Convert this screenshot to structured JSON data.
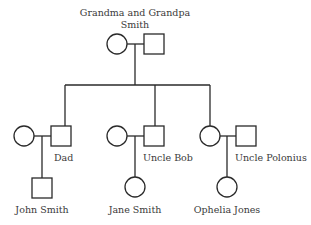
{
  "diagram": {
    "type": "pedigree",
    "generations": [
      {
        "label_line1": "Grandma and Grandpa",
        "label_line2": "Smith",
        "members": [
          {
            "sex": "female"
          },
          {
            "sex": "male"
          }
        ]
      }
    ],
    "couples": [
      {
        "female": "",
        "male": "Dad",
        "child": {
          "name": "John Smith",
          "sex": "male"
        }
      },
      {
        "female": "",
        "male": "Uncle Bob",
        "child": {
          "name": "Jane Smith",
          "sex": "female"
        }
      },
      {
        "female": "",
        "male": "Uncle Polonius",
        "child": {
          "name": "Ophelia Jones",
          "sex": "female"
        }
      }
    ]
  },
  "labels": {
    "grandparents_1": "Grandma and Grandpa",
    "grandparents_2": "Smith",
    "dad": "Dad",
    "uncle_bob": "Uncle Bob",
    "uncle_polonius": "Uncle Polonius",
    "john": "John Smith",
    "jane": "Jane Smith",
    "ophelia": "Ophelia Jones"
  },
  "colors": {
    "stroke": "#2a2a2a",
    "text": "#3a3a3a",
    "background": "#ffffff"
  }
}
